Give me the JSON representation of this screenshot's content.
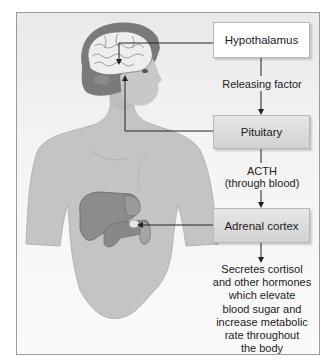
{
  "diagram": {
    "type": "endocrine-pathway",
    "nodes": [
      {
        "id": "hypothalamus",
        "label": "Hypothalamus"
      },
      {
        "id": "pituitary",
        "label": "Pituitary"
      },
      {
        "id": "adrenal",
        "label": "Adrenal cortex"
      }
    ],
    "edges": [
      {
        "from": "hypothalamus",
        "to": "pituitary",
        "label": "Releasing factor"
      },
      {
        "from": "pituitary",
        "to": "adrenal",
        "label_line1": "ACTH",
        "label_line2": "(through blood)"
      }
    ],
    "outcome": {
      "lines": [
        "Secretes cortisol",
        "and other hormones",
        "which elevate",
        "blood sugar and",
        "increase metabolic",
        "rate throughout",
        "the body"
      ]
    },
    "illustration": {
      "subject": "human head and torso",
      "highlighted_organs": [
        "brain",
        "liver",
        "stomach",
        "pancreas",
        "adrenal gland"
      ]
    },
    "colors": {
      "skin": "#c4c4c4",
      "hair": "#7a7a7a",
      "organ": "#8c8c8c",
      "box_white": "#ffffff",
      "box_gray": "#d9d9d9",
      "line": "#222222"
    }
  }
}
